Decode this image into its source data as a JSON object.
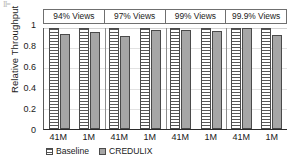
{
  "artifact_text": "II=",
  "chart_data": {
    "type": "bar",
    "title": "",
    "xlabel": "",
    "ylabel": "Relative Throughput",
    "ylim": [
      0,
      1
    ],
    "yticks": [
      1,
      0.8,
      0.6,
      0.4,
      0.2,
      0
    ],
    "ytick_labels": [
      "1",
      "0.8",
      "0.6",
      "0.4",
      "0.2",
      "0"
    ],
    "grid": true,
    "legend_position": "bottom-left",
    "panels": [
      {
        "label": "94% Views",
        "categories": [
          "41M",
          "1M"
        ],
        "values": {
          "Baseline": [
            1.0,
            1.0
          ],
          "CREDULIX": [
            0.94,
            0.96
          ]
        }
      },
      {
        "label": "97% Views",
        "categories": [
          "41M",
          "1M"
        ],
        "values": {
          "Baseline": [
            1.0,
            1.0
          ],
          "CREDULIX": [
            0.92,
            0.98
          ]
        }
      },
      {
        "label": "99% Views",
        "categories": [
          "41M",
          "1M"
        ],
        "values": {
          "Baseline": [
            1.0,
            1.0
          ],
          "CREDULIX": [
            0.98,
            0.97
          ]
        }
      },
      {
        "label": "99.9% Views",
        "categories": [
          "41M",
          "1M"
        ],
        "values": {
          "Baseline": [
            1.0,
            1.0
          ],
          "CREDULIX": [
            1.0,
            0.93
          ]
        }
      }
    ],
    "series": [
      {
        "name": "Baseline",
        "pattern": "horizontal-stripes",
        "color": "#ffffff"
      },
      {
        "name": "CREDULIX",
        "pattern": "solid",
        "color": "#a6a6a6"
      }
    ],
    "legend": [
      "Baseline",
      "CREDULIX"
    ],
    "xtick_labels": [
      "41M",
      "1M",
      "41M",
      "1M",
      "41M",
      "1M",
      "41M",
      "1M"
    ],
    "panel_labels": [
      "94% Views",
      "97% Views",
      "99% Views",
      "99.9% Views"
    ]
  }
}
